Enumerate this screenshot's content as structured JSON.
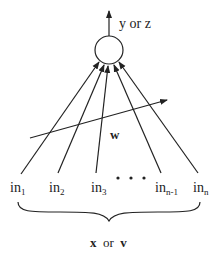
{
  "diagram": {
    "type": "neuron",
    "output_label": "y or z",
    "weight_label": "w",
    "inputs": [
      {
        "base": "in",
        "sub": "1"
      },
      {
        "base": "in",
        "sub": "2"
      },
      {
        "base": "in",
        "sub": "3"
      },
      {
        "base": "in",
        "sub": "n-1"
      },
      {
        "base": "in",
        "sub": "n"
      }
    ],
    "ellipsis": "• • •",
    "input_vector_label": {
      "a": "x",
      "or": "or",
      "b": "v"
    }
  }
}
